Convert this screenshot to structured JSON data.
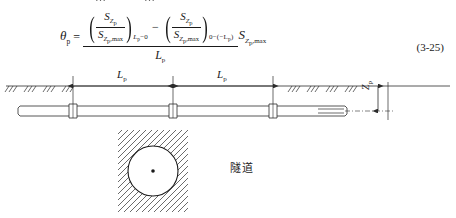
{
  "page": {
    "background_color": "#ffffff",
    "ink_color": "#1a1a1a",
    "top_cut_text": "……"
  },
  "formula": {
    "number": "(3-25)",
    "lhs": {
      "symbol": "θ",
      "subscript": "p"
    },
    "equals": "=",
    "minus": "−",
    "numerator": {
      "term1": {
        "open_paren": "(",
        "close_paren": ")",
        "fraction_numerator_symbol": "S",
        "fraction_numerator_subscript": "Z",
        "fraction_numerator_subsubscript": "p",
        "fraction_denominator_symbol": "S",
        "fraction_denominator_subscript": "Z",
        "fraction_denominator_subsubscript": "p",
        "fraction_denominator_max": ",max",
        "evaluation_subscript": "L",
        "evaluation_subscript_sub": "p",
        "evaluation_subscript_tail": "−0"
      },
      "term2": {
        "open_paren": "(",
        "close_paren": ")",
        "fraction_numerator_symbol": "S",
        "fraction_numerator_subscript": "Z",
        "fraction_numerator_subsubscript": "p",
        "fraction_denominator_symbol": "S",
        "fraction_denominator_subscript": "Z",
        "fraction_denominator_subsubscript": "p",
        "fraction_denominator_max": ",max",
        "evaluation_subscript": "0−(−L",
        "evaluation_subscript_sub": "p",
        "evaluation_subscript_tail": ")"
      }
    },
    "denominator": {
      "symbol": "L",
      "subscript": "p"
    },
    "trailing_factor": {
      "symbol": "S",
      "subscript": "Z",
      "subsubscript": "p",
      "max": ",max"
    }
  },
  "pipe_diagram": {
    "dimension_labels": [
      {
        "symbol": "L",
        "subscript": "p"
      },
      {
        "symbol": "L",
        "subscript": "p"
      }
    ],
    "vertical_dimension": {
      "symbol": "Z",
      "subscript": "p"
    },
    "joint_count": 3,
    "ground_hatch_left_marks": 4,
    "ground_hatch_right_marks": 4
  },
  "tunnel_figure": {
    "label": "隧道",
    "has_center_point": true,
    "hatch_angle_deg": 45
  }
}
